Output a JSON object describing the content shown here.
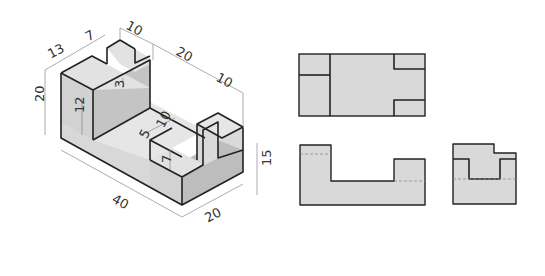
{
  "colors": {
    "face_top": "#e4e4e4",
    "face_front": "#d6d6d6",
    "face_side": "#bdbdbd",
    "ortho_fill": "#d9d9d9",
    "edge": "#222222",
    "dimension": "#888888"
  },
  "isometric": {
    "dimensions": {
      "d13": "13",
      "d7": "7",
      "d10_top": "10",
      "d20_top": "20",
      "d10_right": "10",
      "d20_left": "20",
      "d12": "12",
      "d3": "3",
      "d5": "5",
      "d10_mid": "10",
      "d7_low": "7",
      "d15": "15",
      "d40": "40",
      "d20_bottom": "20"
    }
  },
  "views": {
    "top": "Top view",
    "front": "Front view",
    "side": "Side view"
  }
}
